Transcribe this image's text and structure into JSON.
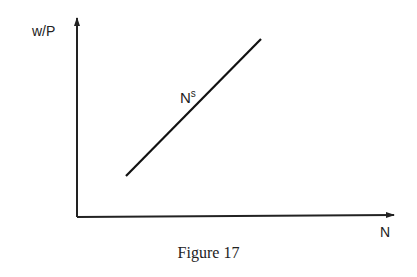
{
  "diagram": {
    "y_axis_label": "w/P",
    "x_axis_label": "N",
    "curve": {
      "label_base": "N",
      "label_superscript": "s",
      "description": "Upward-sloping labor supply curve"
    },
    "caption": "Figure 17"
  }
}
